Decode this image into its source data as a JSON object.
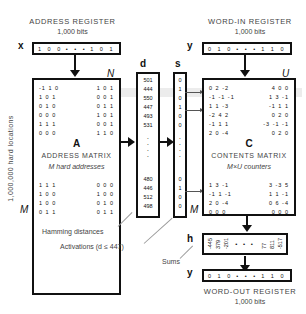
{
  "address_register": {
    "title": "ADDRESS REGISTER",
    "bits": "1,000 bits",
    "var": "x",
    "left_bits": "1 0 0",
    "ellipsis": "• • •",
    "right_bits": "1 0 1"
  },
  "word_in_register": {
    "title": "WORD-IN REGISTER",
    "bits": "1,000 bits",
    "var": "y",
    "left_bits": "0 1 0",
    "ellipsis": "• • •",
    "right_bits": "1 1 0"
  },
  "word_out_register": {
    "title": "WORD-OUT REGISTER",
    "bits": "1,000 bits",
    "var": "y",
    "left_bits": "0 1 0",
    "ellipsis": "• • •",
    "right_bits": "1 1 0"
  },
  "address_matrix": {
    "corner_label": "N",
    "row_end_label": "M",
    "letter": "A",
    "title": "ADDRESS MATRIX",
    "subtitle": "M hard addresses",
    "top_rows": [
      [
        "-1 1 0",
        "1 0 1"
      ],
      [
        "1 0 1",
        "0 0 1"
      ],
      [
        "0 1 0",
        "0 1 1"
      ],
      [
        "0 0 0",
        "1 0 1"
      ],
      [
        "1 1 1",
        "0 0 1"
      ],
      [
        "0 0 0",
        "1 1 0"
      ]
    ],
    "bottom_rows": [
      [
        "1 1 1",
        "0 0 0"
      ],
      [
        "1 0 0",
        "1 0 0"
      ],
      [
        "1 0 0",
        "0 1 0"
      ],
      [
        "0 1 1",
        "0 1 1"
      ]
    ]
  },
  "side_label": "1,000,000 hard locations",
  "distances": {
    "var": "d",
    "top": [
      "501",
      "444",
      "550",
      "447",
      "493",
      "531"
    ],
    "bottom": [
      "480",
      "446",
      "512",
      "498"
    ]
  },
  "activations": {
    "var": "s",
    "top": [
      "0",
      "1",
      "0",
      "1",
      "0",
      "0"
    ],
    "bottom": [
      "0",
      "1",
      "0",
      "0"
    ]
  },
  "contents_matrix": {
    "corner_label": "U",
    "row_end_label": "M",
    "letter": "C",
    "title": "CONTENTS MATRIX",
    "subtitle": "M×U counters",
    "top_rows": [
      [
        "0 2 -2",
        "4 0 0"
      ],
      [
        "-1 -1 -1",
        "1 3 -1"
      ],
      [
        "1 1 -3",
        "-1 1 1"
      ],
      [
        "-2 4 2",
        "0 2 0"
      ],
      [
        "-1 1 1",
        "-3 -1 -1"
      ],
      [
        "2 0 -4",
        "0 2 0"
      ]
    ],
    "bottom_rows": [
      [
        "1 3 -1",
        "3 -3 5"
      ],
      [
        "-1 1 -1",
        "1 1 -1"
      ],
      [
        "2 0 -4",
        "0 6 -4"
      ],
      [
        "0 0 0",
        "0 0 0"
      ]
    ]
  },
  "sums": {
    "var": "h",
    "left": [
      "-445",
      "379",
      "-201"
    ],
    "ellipsis": "• • •",
    "right": [
      "77",
      "811",
      "-517"
    ]
  },
  "annotations": {
    "hamming": "Hamming distances",
    "activations": "Activations (d ≤ 447)",
    "sums": "Sums"
  }
}
